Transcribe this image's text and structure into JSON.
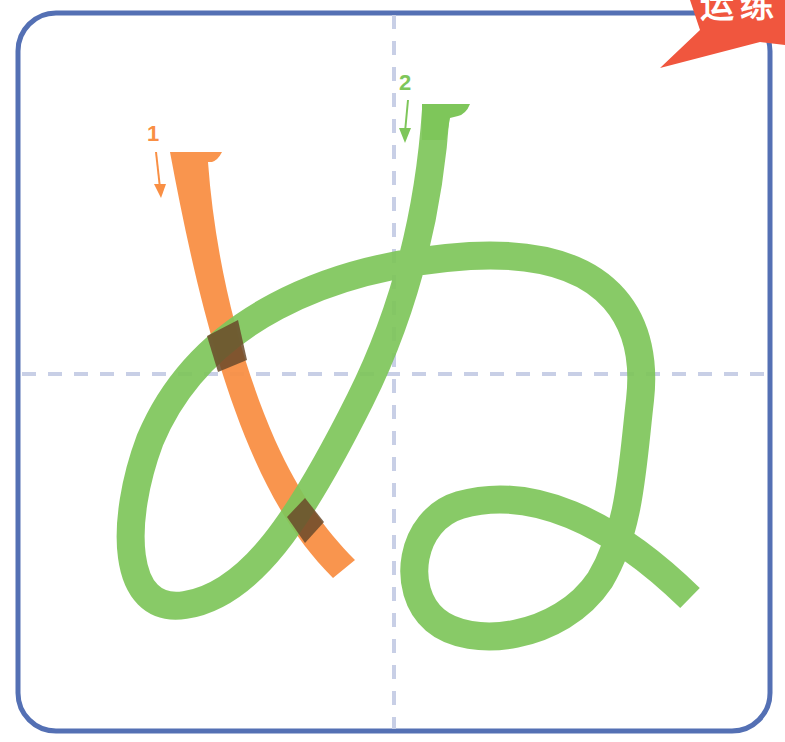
{
  "character": "ぬ",
  "badge": {
    "text": "运练",
    "color": "#f0563e"
  },
  "frame": {
    "border_color": "#5470b4"
  },
  "guides": {
    "color": "#c8cfe6"
  },
  "strokes": [
    {
      "number": "1",
      "color": "#f98f44",
      "label": "stroke-1"
    },
    {
      "number": "2",
      "color": "#7ec65a",
      "label": "stroke-2"
    }
  ],
  "overlap_color": "#6b4a2a"
}
